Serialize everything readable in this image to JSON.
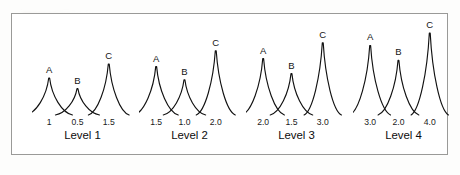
{
  "figure": {
    "frame_color": "#9a9a98",
    "background_color": "#ffffff",
    "ink_color": "#111111"
  },
  "chart_data": {
    "type": "line",
    "title": "",
    "subtitle": "",
    "xlabel": "",
    "ylabel": "",
    "grid": false,
    "legend_position": "none",
    "groups": [
      {
        "level_label": "Level 1",
        "peaks": [
          {
            "letter": "A",
            "concentration": "1",
            "height": 0.42,
            "width": 0.055
          },
          {
            "letter": "B",
            "concentration": "0.5",
            "height": 0.3,
            "width": 0.052
          },
          {
            "letter": "C",
            "concentration": "1.5",
            "height": 0.58,
            "width": 0.048
          }
        ]
      },
      {
        "level_label": "Level 2",
        "peaks": [
          {
            "letter": "A",
            "concentration": "1.5",
            "height": 0.55,
            "width": 0.052
          },
          {
            "letter": "B",
            "concentration": "1.0",
            "height": 0.4,
            "width": 0.05
          },
          {
            "letter": "C",
            "concentration": "2.0",
            "height": 0.73,
            "width": 0.046
          }
        ]
      },
      {
        "level_label": "Level 3",
        "peaks": [
          {
            "letter": "A",
            "concentration": "2.0",
            "height": 0.64,
            "width": 0.05
          },
          {
            "letter": "B",
            "concentration": "1.5",
            "height": 0.47,
            "width": 0.05
          },
          {
            "letter": "C",
            "concentration": "3.0",
            "height": 0.82,
            "width": 0.044
          }
        ]
      },
      {
        "level_label": "Level 4",
        "peaks": [
          {
            "letter": "A",
            "concentration": "3.0",
            "height": 0.79,
            "width": 0.048
          },
          {
            "letter": "B",
            "concentration": "2.0",
            "height": 0.62,
            "width": 0.048
          },
          {
            "letter": "C",
            "concentration": "4.0",
            "height": 0.93,
            "width": 0.044
          }
        ]
      }
    ]
  }
}
